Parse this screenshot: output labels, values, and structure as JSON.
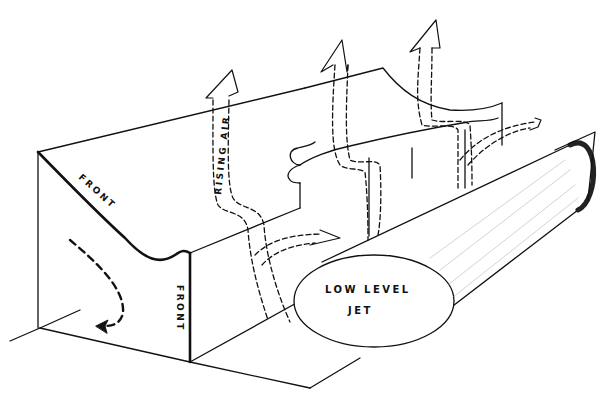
{
  "diagram": {
    "type": "schematic-3d-illustration",
    "labels": {
      "front_top": "FRONT",
      "front_vertical": "FRONT",
      "rising_air": "RISING AIR",
      "jet_line1": "LOW LEVEL",
      "jet_line2": "JET"
    },
    "colors": {
      "ink": "#111111",
      "background": "#ffffff"
    }
  }
}
